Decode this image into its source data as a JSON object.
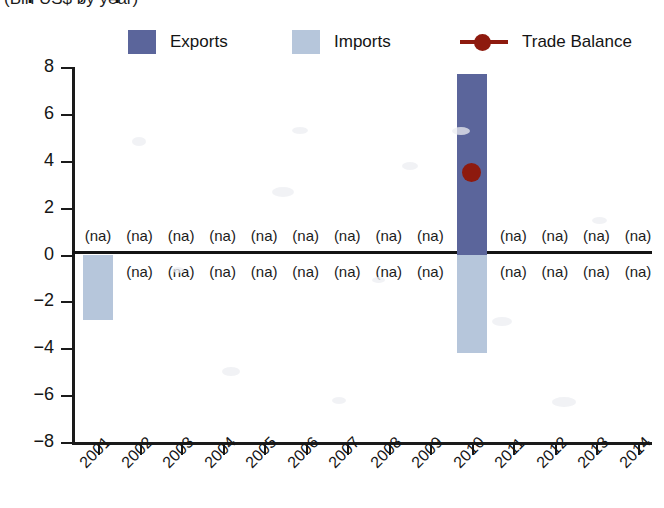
{
  "chart_data": {
    "type": "bar",
    "title": "(Bln US$ by year)",
    "title_cropped_line": "Exports, Imports and Trade Balance",
    "xlabel": "",
    "ylabel": "",
    "ylim": [
      -8,
      8
    ],
    "yticks": [
      8,
      6,
      4,
      2,
      0,
      -2,
      -4,
      -6,
      -8
    ],
    "grid": false,
    "legend_position": "top",
    "na_text": "(na)",
    "categories": [
      "2001",
      "2002",
      "2003",
      "2004",
      "2005",
      "2006",
      "2007",
      "2008",
      "2009",
      "2010",
      "2011",
      "2012",
      "2013",
      "2014"
    ],
    "series": [
      {
        "name": "Exports",
        "color": "#5b659b",
        "values": [
          null,
          null,
          null,
          null,
          null,
          null,
          null,
          null,
          null,
          7.7,
          null,
          null,
          null,
          null
        ]
      },
      {
        "name": "Imports",
        "color": "#b6c6db",
        "values": [
          -2.8,
          null,
          null,
          null,
          null,
          null,
          null,
          null,
          null,
          -4.2,
          null,
          null,
          null,
          null
        ]
      },
      {
        "name": "Trade Balance",
        "color": "#8e1a0e",
        "values": [
          null,
          null,
          null,
          null,
          null,
          null,
          null,
          null,
          null,
          3.5,
          null,
          null,
          null,
          null
        ]
      }
    ]
  },
  "legend": {
    "items": [
      {
        "label": "Exports",
        "color": "#5b659b",
        "marker": "swatch"
      },
      {
        "label": "Imports",
        "color": "#b6c6db",
        "marker": "swatch"
      },
      {
        "label": "Trade Balance",
        "color": "#8e1a0e",
        "marker": "line-dot"
      }
    ]
  },
  "axis": {
    "y_labels": [
      "8",
      "6",
      "4",
      "2",
      "0",
      "-2",
      "-4",
      "-6",
      "-8"
    ],
    "x_labels": [
      "2001",
      "2002",
      "2003",
      "2004",
      "2005",
      "2006",
      "2007",
      "2008",
      "2009",
      "2010",
      "2011",
      "2012",
      "2013",
      "2014"
    ]
  }
}
